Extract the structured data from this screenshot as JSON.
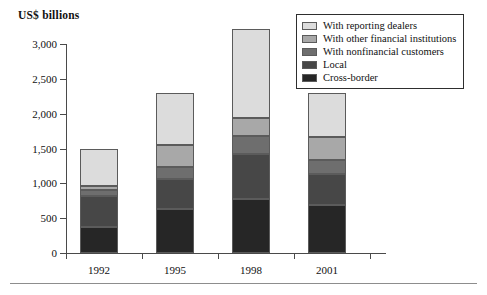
{
  "chart_data": {
    "type": "bar",
    "subtype": "stacked-vertical",
    "title": "US$ billions",
    "xlabel": "",
    "ylabel": "US$ billions",
    "ylim": [
      0,
      3000
    ],
    "yticks": [
      0,
      500,
      1000,
      1500,
      2000,
      2500,
      3000
    ],
    "ytick_labels": [
      "0",
      "500",
      "1,000",
      "1,500",
      "2,000",
      "2,500",
      "3,000"
    ],
    "grid": false,
    "legend_position": "top-right",
    "categories": [
      "1992",
      "1995",
      "1998",
      "2001"
    ],
    "stack_order_bottom_to_top": [
      "Cross-border",
      "Local",
      "With nonfinancial customers",
      "With other financial institutions",
      "With reporting dealers"
    ],
    "series": [
      {
        "name": "Cross-border",
        "color": "#262626",
        "values": [
          370,
          630,
          770,
          690
        ]
      },
      {
        "name": "Local",
        "color": "#474747",
        "values": [
          450,
          430,
          650,
          450
        ]
      },
      {
        "name": "With nonfinancial customers",
        "color": "#6e6e6e",
        "values": [
          80,
          170,
          260,
          190
        ]
      },
      {
        "name": "With other financial institutions",
        "color": "#a8a8a8",
        "values": [
          60,
          320,
          260,
          330
        ]
      },
      {
        "name": "With reporting dealers",
        "color": "#dcdcdc",
        "values": [
          540,
          750,
          1270,
          630
        ]
      }
    ],
    "totals": [
      1500,
      2300,
      3210,
      2290
    ]
  },
  "legend": {
    "entries": [
      {
        "label": "With reporting dealers",
        "color": "#dcdcdc"
      },
      {
        "label": "With other financial institutions",
        "color": "#a8a8a8"
      },
      {
        "label": "With nonfinancial customers",
        "color": "#6e6e6e"
      },
      {
        "label": "Local",
        "color": "#474747"
      },
      {
        "label": "Cross-border",
        "color": "#262626"
      }
    ]
  }
}
